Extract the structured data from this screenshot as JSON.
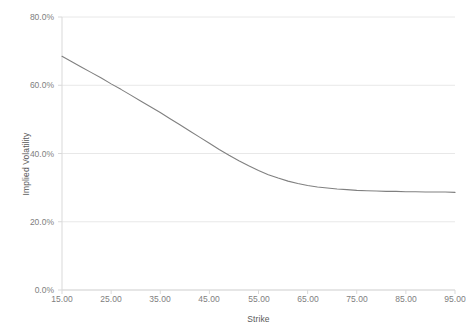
{
  "chart_data": {
    "type": "line",
    "title": "",
    "xlabel": "Strike",
    "ylabel": "Implied Volatility",
    "xlim": [
      15.0,
      95.0
    ],
    "ylim": [
      0.0,
      0.8
    ],
    "grid": true,
    "legend": null,
    "xticks": [
      "15.00",
      "25.00",
      "35.00",
      "45.00",
      "55.00",
      "65.00",
      "75.00",
      "85.00",
      "95.00"
    ],
    "xtick_values": [
      15,
      25,
      35,
      45,
      55,
      65,
      75,
      85,
      95
    ],
    "yticks": [
      "0.0%",
      "20.0%",
      "40.0%",
      "60.0%",
      "80.0%"
    ],
    "ytick_values": [
      0.0,
      0.2,
      0.4,
      0.6,
      0.8
    ],
    "series": [
      {
        "name": "Implied Volatility",
        "color": "#808080",
        "x": [
          15,
          17,
          19,
          21,
          23,
          25,
          27,
          29,
          31,
          33,
          35,
          37,
          39,
          41,
          43,
          45,
          47,
          49,
          51,
          53,
          55,
          57,
          59,
          61,
          63,
          65,
          67,
          69,
          71,
          73,
          75,
          77,
          79,
          81,
          83,
          85,
          87,
          89,
          91,
          93,
          95
        ],
        "values": [
          0.685,
          0.669,
          0.653,
          0.637,
          0.621,
          0.604,
          0.588,
          0.571,
          0.554,
          0.537,
          0.52,
          0.502,
          0.484,
          0.466,
          0.448,
          0.43,
          0.412,
          0.395,
          0.379,
          0.364,
          0.35,
          0.338,
          0.328,
          0.319,
          0.312,
          0.306,
          0.302,
          0.299,
          0.296,
          0.294,
          0.292,
          0.291,
          0.29,
          0.289,
          0.289,
          0.288,
          0.288,
          0.287,
          0.287,
          0.287,
          0.286
        ]
      }
    ]
  },
  "axes": {
    "ylabel": "Implied Volatility",
    "xlabel": "Strike"
  },
  "style": {
    "line_color": "#808080",
    "grid_color": "#e8e8e8",
    "axis_color": "#d9d9d9",
    "tick_text_color": "#808080",
    "label_text_color": "#595959",
    "background": "#ffffff"
  }
}
